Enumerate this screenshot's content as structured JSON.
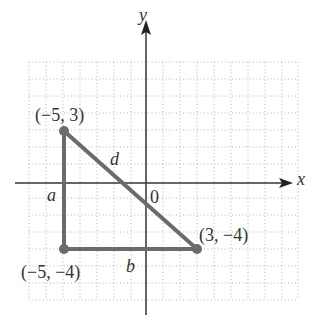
{
  "figure": {
    "axes": {
      "x_label": "x",
      "y_label": "y",
      "origin_label": "0"
    },
    "points": [
      {
        "label": "(−5, 3)",
        "x": -5,
        "y": 3
      },
      {
        "label": "(−5, −4)",
        "x": -5,
        "y": -4
      },
      {
        "label": "(3, −4)",
        "x": 3,
        "y": -4
      }
    ],
    "sides": {
      "vertical": "a",
      "horizontal": "b",
      "hypotenuse": "d"
    },
    "colors": {
      "triangle": "#6b6b6b",
      "axis": "#333333",
      "grid": "#b0b0b0"
    }
  }
}
